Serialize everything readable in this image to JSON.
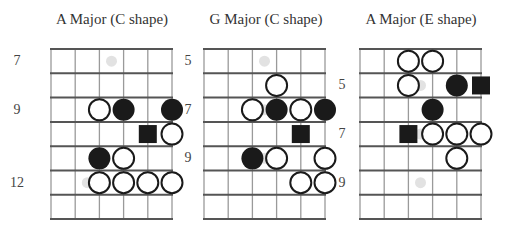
{
  "diagrams": [
    {
      "title": "A Major (C shape)",
      "rows": 7,
      "strings": 6,
      "fret_labels": [
        {
          "row": 0,
          "text": "7",
          "side": "left"
        },
        {
          "row": 2,
          "text": "9",
          "side": "left"
        },
        {
          "row": 5,
          "text": "12",
          "side": "left"
        }
      ],
      "notes": [
        {
          "row": 0,
          "pos": 2.5,
          "type": "ghost"
        },
        {
          "row": 2,
          "pos": 2,
          "type": "open"
        },
        {
          "row": 2,
          "pos": 3,
          "type": "filled"
        },
        {
          "row": 2,
          "pos": 5,
          "type": "filled"
        },
        {
          "row": 3,
          "pos": 4,
          "type": "root"
        },
        {
          "row": 3,
          "pos": 5,
          "type": "open"
        },
        {
          "row": 4,
          "pos": 2,
          "type": "filled"
        },
        {
          "row": 4,
          "pos": 3,
          "type": "open"
        },
        {
          "row": 5,
          "pos": 1.5,
          "type": "ghost"
        },
        {
          "row": 5,
          "pos": 2,
          "type": "open"
        },
        {
          "row": 5,
          "pos": 3,
          "type": "open"
        },
        {
          "row": 5,
          "pos": 4,
          "type": "open"
        },
        {
          "row": 5,
          "pos": 5,
          "type": "open"
        }
      ]
    },
    {
      "title": "G Major (C shape)",
      "rows": 7,
      "strings": 6,
      "fret_labels": [
        {
          "row": 0,
          "text": "5",
          "side": "left"
        },
        {
          "row": 2,
          "text": "7",
          "side": "left"
        },
        {
          "row": 4,
          "text": "9",
          "side": "left"
        },
        {
          "row": 1,
          "text": "5",
          "side": "right"
        },
        {
          "row": 3,
          "text": "7",
          "side": "right"
        },
        {
          "row": 5,
          "text": "9",
          "side": "right"
        }
      ],
      "notes": [
        {
          "row": 0,
          "pos": 2.5,
          "type": "ghost"
        },
        {
          "row": 1,
          "pos": 3,
          "type": "open"
        },
        {
          "row": 2,
          "pos": 2,
          "type": "open"
        },
        {
          "row": 2,
          "pos": 2.5,
          "type": "ghost"
        },
        {
          "row": 2,
          "pos": 3,
          "type": "filled"
        },
        {
          "row": 2,
          "pos": 4,
          "type": "open"
        },
        {
          "row": 2,
          "pos": 5,
          "type": "filled"
        },
        {
          "row": 3,
          "pos": 4,
          "type": "root"
        },
        {
          "row": 4,
          "pos": 2,
          "type": "filled"
        },
        {
          "row": 4,
          "pos": 2.5,
          "type": "ghost"
        },
        {
          "row": 4,
          "pos": 3,
          "type": "open"
        },
        {
          "row": 4,
          "pos": 5,
          "type": "open"
        },
        {
          "row": 5,
          "pos": 4,
          "type": "open"
        },
        {
          "row": 5,
          "pos": 5,
          "type": "open"
        }
      ]
    },
    {
      "title": "A Major (E shape)",
      "rows": 7,
      "strings": 6,
      "fret_labels": [],
      "notes": [
        {
          "row": 0,
          "pos": 2,
          "type": "open"
        },
        {
          "row": 0,
          "pos": 3,
          "type": "open"
        },
        {
          "row": 1,
          "pos": 2,
          "type": "open"
        },
        {
          "row": 1,
          "pos": 2.5,
          "type": "ghost"
        },
        {
          "row": 1,
          "pos": 4,
          "type": "filled"
        },
        {
          "row": 1,
          "pos": 5,
          "type": "root"
        },
        {
          "row": 2,
          "pos": 3,
          "type": "filled"
        },
        {
          "row": 3,
          "pos": 2,
          "type": "root"
        },
        {
          "row": 3,
          "pos": 2.5,
          "type": "ghost"
        },
        {
          "row": 3,
          "pos": 3,
          "type": "open"
        },
        {
          "row": 3,
          "pos": 4,
          "type": "open"
        },
        {
          "row": 3,
          "pos": 5,
          "type": "open"
        },
        {
          "row": 4,
          "pos": 4,
          "type": "open"
        },
        {
          "row": 5,
          "pos": 2.5,
          "type": "ghost"
        }
      ]
    }
  ],
  "colors": {
    "grid_line": "#555555",
    "grid_string": "#9a9a9a",
    "filled_note": "#1a1a1a",
    "open_note_stroke": "#1a1a1a",
    "ghost_note": "#e2e2e2",
    "text": "#333333"
  }
}
